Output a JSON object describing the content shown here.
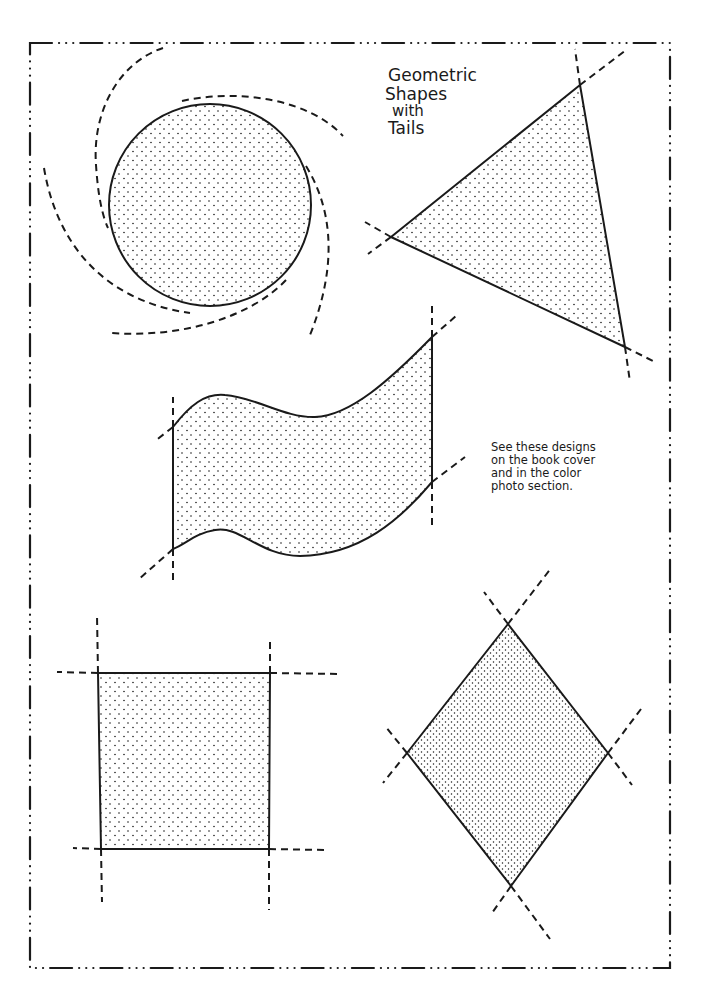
{
  "title": {
    "lines": [
      "Geometric",
      "Shapes",
      "with",
      "Tails"
    ]
  },
  "note": {
    "lines": [
      "See these designs",
      "on the book cover",
      "and in the color",
      "photo section."
    ]
  },
  "colors": {
    "ink": "#1a1a1a",
    "background": "#ffffff"
  },
  "shapes": [
    {
      "name": "circle",
      "fill": "stipple",
      "tails": "dashed spiral arcs"
    },
    {
      "name": "triangle",
      "fill": "stipple",
      "tails": "dashed lines through vertices"
    },
    {
      "name": "wave-banner",
      "fill": "stipple",
      "tails": "dashed lines through corners"
    },
    {
      "name": "square",
      "fill": "stipple",
      "tails": "dashed lines through corners"
    },
    {
      "name": "diamond",
      "fill": "stipple",
      "tails": "dashed lines through vertices"
    }
  ],
  "border": {
    "style": "dash-dot-dot-dot"
  }
}
